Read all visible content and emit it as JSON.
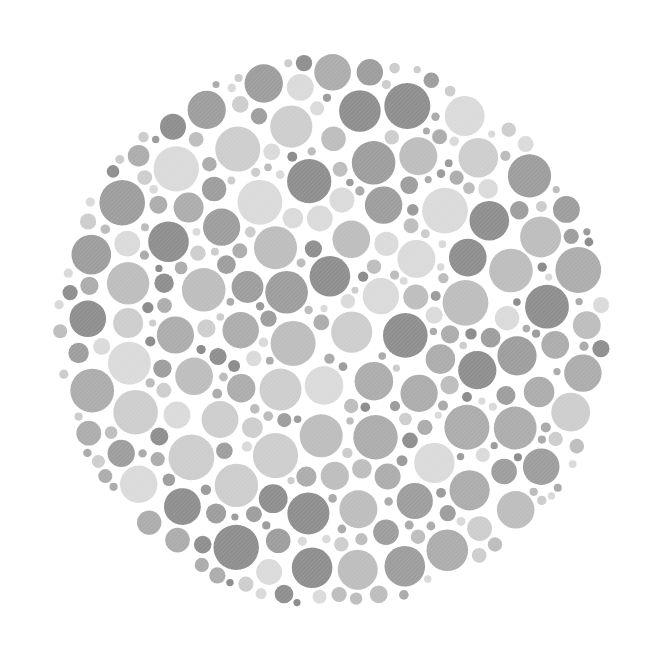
{
  "plate": {
    "kind": "color-vision-test-plate",
    "rendering": "grayscale dot pattern",
    "hidden_figure_visible": "none",
    "canvas": {
      "width": 650,
      "height": 669,
      "background": "#ffffff"
    },
    "disc": {
      "cx": 332,
      "cy": 331,
      "r": 279
    },
    "palette": [
      "#8e8e8e",
      "#9d9d9d",
      "#acacac",
      "#bdbdbd",
      "#cdcdcd",
      "#dadada"
    ],
    "palette_weights": [
      0.12,
      0.16,
      0.2,
      0.18,
      0.18,
      0.16
    ],
    "radius_classes": [
      {
        "r_min": 3.5,
        "r_max": 6.5,
        "weight": 0.5
      },
      {
        "r_min": 7,
        "r_max": 11,
        "weight": 0.3
      },
      {
        "r_min": 12,
        "r_max": 17,
        "weight": 0.14
      },
      {
        "r_min": 18,
        "r_max": 23,
        "weight": 0.06
      }
    ],
    "gap": 2.2,
    "attempts": 26000,
    "seed": 1337,
    "hatch": {
      "angle": 45,
      "spacing": 3,
      "stroke": "#ffffff",
      "opacity": 0.18
    }
  }
}
